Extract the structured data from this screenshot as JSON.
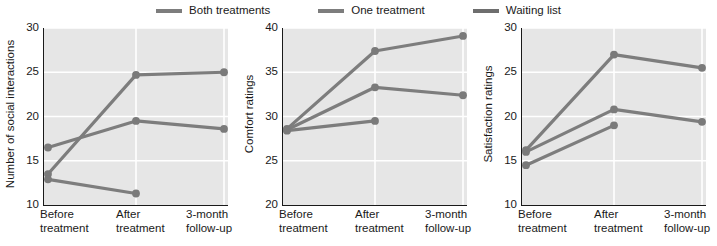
{
  "legend": {
    "position": "top-center",
    "items": [
      {
        "label": "Both treatments",
        "color": "#7d7d7d",
        "key": "both"
      },
      {
        "label": "One treatment",
        "color": "#7d7d7d",
        "key": "one"
      },
      {
        "label": "Waiting list",
        "color": "#6e6e6e",
        "key": "waiting"
      }
    ]
  },
  "style": {
    "plot_background": "#e6e6e6",
    "gridline_color": "#ffffff",
    "axis_color": "#1a1a1a",
    "line_color": "#7d7d7d",
    "marker_color": "#7a7a7a",
    "text_color": "#1a1a1a"
  },
  "chart_data": [
    {
      "type": "line",
      "title": "",
      "xlabel": "",
      "ylabel": "Number of social interactions",
      "categories": [
        "Before\ntreatment",
        "After\ntreatment",
        "3-month\nfollow-up"
      ],
      "x": [
        "Before treatment",
        "After treatment",
        "3-month follow-up"
      ],
      "ylim": [
        10,
        30
      ],
      "yticks": [
        10,
        15,
        20,
        25,
        30
      ],
      "ytick_labels": [
        "10",
        "15",
        "20",
        "25",
        "30"
      ],
      "grid": true,
      "series": [
        {
          "name": "Both treatments",
          "values": [
            13.5,
            24.7,
            25.0
          ]
        },
        {
          "name": "One treatment",
          "values": [
            16.5,
            19.5,
            18.6
          ]
        },
        {
          "name": "Waiting list",
          "values": [
            12.9,
            11.3,
            null
          ]
        }
      ]
    },
    {
      "type": "line",
      "title": "",
      "xlabel": "",
      "ylabel": "Comfort ratings",
      "categories": [
        "Before\ntreatment",
        "After\ntreatment",
        "3-month\nfollow-up"
      ],
      "x": [
        "Before treatment",
        "After treatment",
        "3-month follow-up"
      ],
      "ylim": [
        20,
        40
      ],
      "yticks": [
        20,
        25,
        30,
        35,
        40
      ],
      "ytick_labels": [
        "20",
        "25",
        "30",
        "35",
        "40"
      ],
      "grid": true,
      "series": [
        {
          "name": "Both treatments",
          "values": [
            28.6,
            37.4,
            39.1
          ]
        },
        {
          "name": "One treatment",
          "values": [
            28.5,
            33.3,
            32.4
          ]
        },
        {
          "name": "Waiting list",
          "values": [
            28.4,
            29.5,
            null
          ]
        }
      ]
    },
    {
      "type": "line",
      "title": "",
      "xlabel": "",
      "ylabel": "Satisfaction ratings",
      "categories": [
        "Before\ntreatment",
        "After\ntreatment",
        "3-month\nfollow-up"
      ],
      "x": [
        "Before treatment",
        "After treatment",
        "3-month follow-up"
      ],
      "ylim": [
        10,
        30
      ],
      "yticks": [
        10,
        15,
        20,
        25,
        30
      ],
      "ytick_labels": [
        "10",
        "15",
        "20",
        "25",
        "30"
      ],
      "grid": true,
      "series": [
        {
          "name": "Both treatments",
          "values": [
            16.2,
            27.0,
            25.5
          ]
        },
        {
          "name": "One treatment",
          "values": [
            16.0,
            20.8,
            19.4
          ]
        },
        {
          "name": "Waiting list",
          "values": [
            14.5,
            19.0,
            null
          ]
        }
      ]
    }
  ]
}
